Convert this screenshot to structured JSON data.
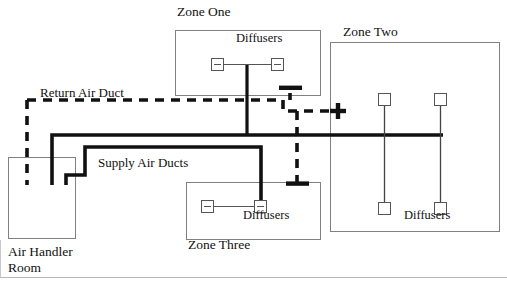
{
  "diagram": {
    "title_visible": false,
    "colors": {
      "background": "#ffffff",
      "supply_duct": "#111111",
      "return_duct": "#111111",
      "zone_wall": "#777777",
      "frame": "#bbbbbb",
      "branch_line": "#444444"
    }
  },
  "labels": {
    "zone_one": "Zone One",
    "zone_two": "Zone Two",
    "zone_three": "Zone Three",
    "air_handler_room": "Air Handler\nRoom",
    "air_handler_room_line1": "Air Handler",
    "air_handler_room_line2": "Room",
    "return_air_duct": "Return Air Duct",
    "supply_air_ducts": "Supply Air Ducts",
    "diffusers_zone_one": "Diffusers",
    "diffusers_zone_two": "Diffusers",
    "diffusers_zone_three": "Diffusers"
  },
  "zones": [
    {
      "id": "zone-one",
      "label": "Zone One",
      "box": {
        "x": 175,
        "y": 30,
        "w": 145,
        "h": 65
      },
      "label_pos": {
        "x": 177,
        "y": 8
      },
      "diffuser_label": "Diffusers",
      "diffuser_label_pos": {
        "x": 236,
        "y": 34
      },
      "diffusers": [
        {
          "x": 211,
          "y": 58,
          "w": 13,
          "h": 13,
          "style": "tick"
        },
        {
          "x": 271,
          "y": 58,
          "w": 13,
          "h": 13,
          "style": "tick"
        }
      ],
      "return_grilles": [
        {
          "x": 290,
          "y": 88,
          "orientation": "horizontal-bar"
        }
      ]
    },
    {
      "id": "zone-two",
      "label": "Zone Two",
      "box": {
        "x": 330,
        "y": 42,
        "w": 170,
        "h": 190
      },
      "label_pos": {
        "x": 343,
        "y": 27
      },
      "diffuser_label": "Diffusers",
      "diffuser_label_pos": {
        "x": 406,
        "y": 211
      },
      "diffusers": [
        {
          "x": 378,
          "y": 93,
          "w": 13,
          "h": 13,
          "style": "plain"
        },
        {
          "x": 434,
          "y": 93,
          "w": 13,
          "h": 13,
          "style": "plain"
        },
        {
          "x": 378,
          "y": 202,
          "w": 13,
          "h": 13,
          "style": "plain"
        },
        {
          "x": 434,
          "y": 202,
          "w": 13,
          "h": 13,
          "style": "plain"
        }
      ],
      "return_grilles": [
        {
          "x": 334,
          "y": 110,
          "orientation": "vertical-bar"
        }
      ]
    },
    {
      "id": "zone-three",
      "label": "Zone Three",
      "box": {
        "x": 186,
        "y": 182,
        "w": 135,
        "h": 58
      },
      "label_pos": {
        "x": 188,
        "y": 240
      },
      "diffuser_label": "Diffusers",
      "diffuser_label_pos": {
        "x": 243,
        "y": 210
      },
      "diffusers": [
        {
          "x": 201,
          "y": 200,
          "w": 13,
          "h": 13,
          "style": "tick"
        },
        {
          "x": 254,
          "y": 200,
          "w": 13,
          "h": 13,
          "style": "tick"
        }
      ],
      "return_grilles": [
        {
          "x": 297,
          "y": 183,
          "orientation": "horizontal-bar"
        }
      ]
    }
  ],
  "air_handler": {
    "id": "air-handler-room",
    "label_line1": "Air Handler",
    "label_line2": "Room",
    "box": {
      "x": 8,
      "y": 157,
      "w": 68,
      "h": 82
    },
    "label_pos": {
      "x": 8,
      "y": 247
    }
  },
  "ducts": {
    "return": {
      "label": "Return Air Duct",
      "label_pos": {
        "x": 40,
        "y": 88
      },
      "style": "dashed",
      "stroke_width": 3.6,
      "dash": "9 7"
    },
    "supply": {
      "label": "Supply Air Ducts",
      "label_pos": {
        "x": 98,
        "y": 157
      },
      "style": "solid",
      "stroke_width": 3.6
    }
  },
  "frame": {
    "top": 0,
    "bottom": 277,
    "left": 0,
    "right": 507
  }
}
